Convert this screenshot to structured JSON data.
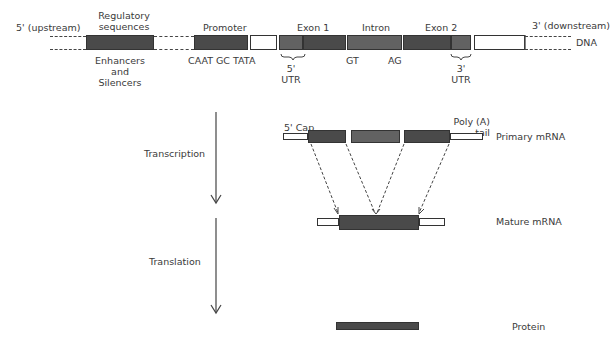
{
  "dna": {
    "upstream_label": "5' (upstream)",
    "downstream_label": "3' (downstream)",
    "strand_label": "DNA",
    "regulatory_label_line1": "Regulatory",
    "regulatory_label_line2": "sequences",
    "enhancers_line1": "Enhancers",
    "enhancers_line2": "and",
    "enhancers_line3": "Silencers",
    "promoter_label": "Promoter",
    "promoter_elements": "CAAT GC TATA",
    "exon1_label": "Exon 1",
    "intron_label": "Intron",
    "exon2_label": "Exon 2",
    "gt_label": "GT",
    "ag_label": "AG",
    "utr5_line1": "5'",
    "utr5_line2": "UTR",
    "utr3_line1": "3'",
    "utr3_line2": "UTR"
  },
  "primary_mrna": {
    "label": "Primary mRNA",
    "cap_label": "5' Cap",
    "polya_line1": "Poly (A)",
    "polya_line2": "tail"
  },
  "mature_mrna": {
    "label": "Mature mRNA"
  },
  "protein": {
    "label": "Protein"
  },
  "process": {
    "transcription": "Transcription",
    "translation": "Translation"
  },
  "colors": {
    "exon": "#4a4a4a",
    "intron": "#626262",
    "utr": "#686868",
    "outline": "#333333"
  }
}
